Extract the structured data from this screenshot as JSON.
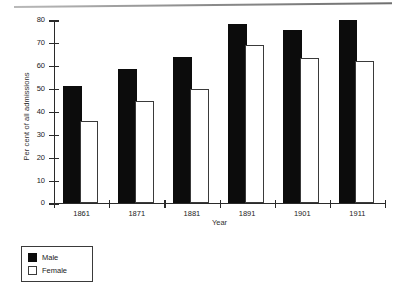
{
  "chart_data": {
    "type": "bar",
    "title": "",
    "xlabel": "Year",
    "ylabel": "Per cent of all admissions",
    "categories": [
      "1861",
      "1871",
      "1881",
      "1891",
      "1901",
      "1911"
    ],
    "series": [
      {
        "name": "Male",
        "values": [
          50,
          57.5,
          63,
          77,
          74.5,
          79
        ],
        "color": "#0c0c0c"
      },
      {
        "name": "Female",
        "values": [
          35,
          43.5,
          49,
          68,
          62.5,
          61
        ],
        "color": "#ffffff"
      }
    ],
    "ylim": [
      0,
      80
    ],
    "ytick_labels": [
      "0",
      "10",
      "20",
      "30",
      "40",
      "50",
      "60",
      "70",
      "80"
    ],
    "ytick_values": [
      0,
      10,
      20,
      30,
      40,
      50,
      60,
      70,
      80
    ],
    "grid": false,
    "legend_position": "below-left",
    "legend_entries": [
      "Male",
      "Female"
    ]
  }
}
